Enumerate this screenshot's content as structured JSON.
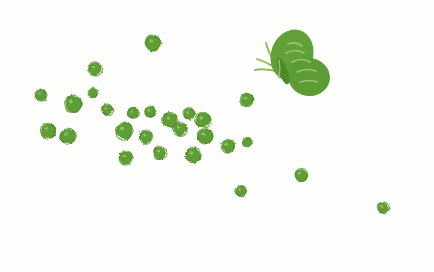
{
  "artwork": {
    "title": "Butterfly with scattered green dots",
    "medium": "stamped-ink-illustration",
    "canvas": {
      "width": 434,
      "height": 272,
      "background_color": "#fdfdfb"
    },
    "palette": {
      "ink_green": "#5f9e36",
      "ink_green_dark": "#4e8a2b",
      "ink_green_light": "#8dbf63",
      "ink_green_pale": "#a9cf86",
      "background": "#fdfdfb"
    }
  },
  "butterfly": {
    "label": "butterfly",
    "color": "#61a038",
    "body": {
      "cx": 283,
      "cy": 71,
      "angle_deg": -20
    },
    "wings": [
      {
        "name": "upper-wing",
        "cx": 292,
        "cy": 55,
        "rx": 21,
        "ry": 26,
        "rotate": 18,
        "color": "#62a039"
      },
      {
        "name": "lower-wing",
        "cx": 309,
        "cy": 77,
        "rx": 21,
        "ry": 19,
        "rotate": 10,
        "color": "#5d9c34"
      }
    ],
    "antennae": [
      {
        "name": "antenna-upper",
        "path": "M 281 70 C 274 62 268 52 266 43",
        "color": "#8dbf63"
      },
      {
        "name": "antenna-lower",
        "path": "M 281 72 C 272 70 262 68 255 70",
        "color": "#8dbf63"
      },
      {
        "name": "antenna-mid",
        "path": "M 281 71 C 273 66 264 61 257 59",
        "color": "#9ac772"
      }
    ],
    "wing_highlights": [
      {
        "path": "M 288 44 C 293 42 298 43 302 46",
        "color": "#a4cc7e"
      },
      {
        "path": "M 286 53 C 292 50 299 50 304 53",
        "color": "#a4cc7e"
      },
      {
        "path": "M 292 62 C 298 59 305 59 310 62",
        "color": "#a4cc7e"
      },
      {
        "path": "M 297 72 C 303 69 310 69 316 71",
        "color": "#a4cc7e"
      },
      {
        "path": "M 300 82 C 306 80 312 80 317 82",
        "color": "#a4cc7e"
      },
      {
        "path": "M 279 60 C 280 66 280 72 279 78",
        "color": "#9ac772"
      }
    ]
  },
  "dots": [
    {
      "id": "dot-01",
      "cx": 153,
      "cy": 43,
      "r": 8
    },
    {
      "id": "dot-02",
      "cx": 95,
      "cy": 69,
      "r": 7
    },
    {
      "id": "dot-03",
      "cx": 41,
      "cy": 95,
      "r": 6
    },
    {
      "id": "dot-04",
      "cx": 93,
      "cy": 93,
      "r": 5
    },
    {
      "id": "dot-05",
      "cx": 73,
      "cy": 104,
      "r": 9
    },
    {
      "id": "dot-06",
      "cx": 247,
      "cy": 100,
      "r": 7
    },
    {
      "id": "dot-07",
      "cx": 107,
      "cy": 110,
      "r": 6
    },
    {
      "id": "dot-08",
      "cx": 133,
      "cy": 113,
      "r": 6
    },
    {
      "id": "dot-09",
      "cx": 150,
      "cy": 112,
      "r": 6
    },
    {
      "id": "dot-10",
      "cx": 170,
      "cy": 120,
      "r": 8
    },
    {
      "id": "dot-11",
      "cx": 189,
      "cy": 114,
      "r": 6
    },
    {
      "id": "dot-12",
      "cx": 203,
      "cy": 120,
      "r": 8
    },
    {
      "id": "dot-13",
      "cx": 48,
      "cy": 131,
      "r": 8
    },
    {
      "id": "dot-14",
      "cx": 68,
      "cy": 136,
      "r": 8
    },
    {
      "id": "dot-15",
      "cx": 124,
      "cy": 131,
      "r": 9
    },
    {
      "id": "dot-16",
      "cx": 146,
      "cy": 137,
      "r": 7
    },
    {
      "id": "dot-17",
      "cx": 180,
      "cy": 129,
      "r": 7
    },
    {
      "id": "dot-18",
      "cx": 205,
      "cy": 136,
      "r": 8
    },
    {
      "id": "dot-19",
      "cx": 228,
      "cy": 146,
      "r": 7
    },
    {
      "id": "dot-20",
      "cx": 247,
      "cy": 142,
      "r": 5
    },
    {
      "id": "dot-21",
      "cx": 126,
      "cy": 158,
      "r": 7
    },
    {
      "id": "dot-22",
      "cx": 160,
      "cy": 153,
      "r": 7
    },
    {
      "id": "dot-23",
      "cx": 193,
      "cy": 155,
      "r": 8
    },
    {
      "id": "dot-24",
      "cx": 301,
      "cy": 175,
      "r": 7
    },
    {
      "id": "dot-25",
      "cx": 241,
      "cy": 191,
      "r": 6
    },
    {
      "id": "dot-26",
      "cx": 383,
      "cy": 208,
      "r": 6
    }
  ]
}
